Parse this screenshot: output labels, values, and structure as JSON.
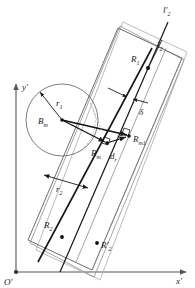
{
  "figure": {
    "background_color": "#ffffff",
    "line_color_dark": "#1a1a1a",
    "line_color_gray": "#8c8c8c",
    "line_color_light": "#b0b0b0"
  },
  "axes": {
    "origin_label": "O′",
    "x_label": "x′",
    "y_label": "y′",
    "axis_color": "#555555"
  },
  "labels": {
    "l2_prime": "l′",
    "l2_prime_sub": "2",
    "l2": "l",
    "l2_sub": "2",
    "R1": "R",
    "R1_sub": "1",
    "R2": "R",
    "R2_sub": "2",
    "R2_prime": "R′",
    "R2_prime_sub": "2",
    "Rm": "R",
    "Rm_sub": "m",
    "Rm1": "R",
    "Rm1_sub": "m1",
    "Bm": "B",
    "Bm_sub": "m",
    "r1": "r",
    "r1_sub": "1",
    "r2": "r",
    "r2_sub": "2",
    "dr": "d",
    "dr_sub": "r",
    "delta": "δ"
  },
  "geometry": {
    "circle": {
      "cx": 62,
      "cy": 120,
      "r": 36
    },
    "points": {
      "Bm": {
        "x": 62,
        "y": 120
      },
      "R1": {
        "x": 148,
        "y": 68
      },
      "Rm": {
        "x": 107,
        "y": 143
      },
      "Rm1": {
        "x": 129,
        "y": 136
      },
      "R2": {
        "x": 62,
        "y": 237
      },
      "R2_prime": {
        "x": 97,
        "y": 243
      }
    }
  }
}
